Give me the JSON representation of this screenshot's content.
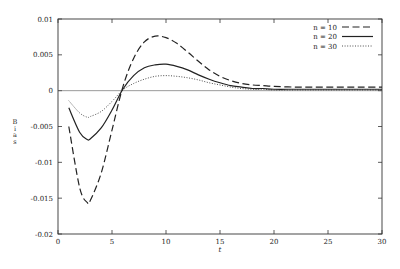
{
  "chart_data": {
    "type": "line",
    "title": "",
    "xlabel": "t",
    "ylabel": "Bias",
    "xlim": [
      0,
      30
    ],
    "ylim": [
      -0.02,
      0.01
    ],
    "xticks": [
      0,
      5,
      10,
      15,
      20,
      25,
      30
    ],
    "yticks": [
      0.01,
      0.005,
      0,
      -0.005,
      -0.01,
      -0.015,
      -0.02
    ],
    "ytick_labels": [
      "0.01",
      "0.005",
      "0",
      "-0.005",
      "-0.01",
      "-0.015",
      "-0.02"
    ],
    "xtick_labels": [
      "0",
      "5",
      "10",
      "15",
      "20",
      "25",
      "30"
    ],
    "grid": false,
    "zero_line": true,
    "legend_position": "upper right",
    "x": [
      1,
      2,
      2.7,
      3,
      4,
      5,
      6,
      7,
      8,
      9,
      10,
      11,
      12,
      13,
      14,
      15,
      16,
      17,
      18,
      19,
      20,
      22,
      24,
      26,
      28,
      30
    ],
    "series": [
      {
        "name": "n = 10",
        "style": "dashed",
        "values": [
          -0.005,
          -0.0135,
          -0.0156,
          -0.0153,
          -0.0115,
          -0.0055,
          0.0005,
          0.0045,
          0.0068,
          0.0076,
          0.0074,
          0.0066,
          0.0054,
          0.0041,
          0.0029,
          0.002,
          0.0014,
          0.001,
          0.0008,
          0.0007,
          0.0006,
          0.0005,
          0.0005,
          0.0005,
          0.0005,
          0.0005
        ]
      },
      {
        "name": "n = 20",
        "style": "solid",
        "values": [
          -0.0024,
          -0.0058,
          -0.0068,
          -0.0067,
          -0.0052,
          -0.0027,
          0.0002,
          0.0021,
          0.0032,
          0.0036,
          0.0037,
          0.0034,
          0.0029,
          0.0022,
          0.0016,
          0.0011,
          0.0007,
          0.0005,
          0.0003,
          0.0003,
          0.0002,
          0.0002,
          0.0002,
          0.0002,
          0.0002,
          0.0002
        ]
      },
      {
        "name": "n = 30",
        "style": "dotted",
        "values": [
          -0.0014,
          -0.0031,
          -0.0037,
          -0.0036,
          -0.0029,
          -0.0015,
          0.0001,
          0.001,
          0.0016,
          0.002,
          0.0021,
          0.002,
          0.0018,
          0.0015,
          0.0011,
          0.0008,
          0.0005,
          0.0003,
          0.0002,
          0.0002,
          0.0001,
          0.0001,
          0.0001,
          0.0001,
          0.0001,
          0.0001
        ]
      }
    ]
  },
  "legend": {
    "items": [
      {
        "label": "n = 10",
        "style": "dashed"
      },
      {
        "label": "n = 20",
        "style": "solid"
      },
      {
        "label": "n = 30",
        "style": "dotted"
      }
    ]
  },
  "colors": {
    "line": "#222222",
    "frame": "#333333",
    "zero_line": "#555555"
  }
}
